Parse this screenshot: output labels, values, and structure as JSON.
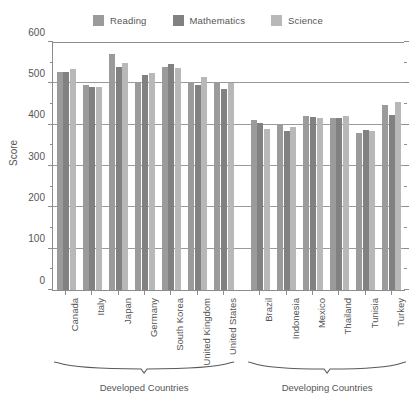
{
  "legend": {
    "entries": [
      {
        "label": "Reading",
        "color": "#9b9b9b",
        "icon": "legend-swatch-icon"
      },
      {
        "label": "Mathematics",
        "color": "#818181",
        "icon": "legend-swatch-icon"
      },
      {
        "label": "Science",
        "color": "#b8b8b8",
        "icon": "legend-swatch-icon"
      }
    ]
  },
  "axes": {
    "ylabel": "Score",
    "yticks": [
      0,
      100,
      200,
      300,
      400,
      500,
      600
    ],
    "yminor": [
      50,
      150,
      250,
      350,
      450,
      550
    ],
    "ylim": [
      0,
      600
    ]
  },
  "groups": [
    {
      "label": "Developed Countries",
      "count": 7
    },
    {
      "label": "Developing Countries",
      "count": 6
    }
  ],
  "chart_data": {
    "type": "bar",
    "title": "",
    "subtitle": "",
    "xlabel": "",
    "ylabel": "Score",
    "ylim": [
      0,
      600
    ],
    "yticks": [
      0,
      100,
      200,
      300,
      400,
      500,
      600
    ],
    "minor_tick_interval": 50,
    "grid": true,
    "grid_axis": "y",
    "legend_position": "top-center",
    "categories": [
      "Canada",
      "Italy",
      "Japan",
      "Germany",
      "South Korea",
      "United Kingdom",
      "United States",
      "Brazil",
      "Indonesia",
      "Mexico",
      "Thailand",
      "Tunisia",
      "Turkey"
    ],
    "category_groups": [
      {
        "name": "Developed Countries",
        "categories": [
          "Canada",
          "Italy",
          "Japan",
          "Germany",
          "South Korea",
          "United Kingdom",
          "United States"
        ]
      },
      {
        "name": "Developing Countries",
        "categories": [
          "Brazil",
          "Indonesia",
          "Mexico",
          "Thailand",
          "Tunisia",
          "Turkey"
        ]
      }
    ],
    "series": [
      {
        "name": "Reading",
        "color": "#9b9b9b",
        "values": [
          527,
          495,
          570,
          500,
          540,
          500,
          500,
          412,
          402,
          420,
          417,
          380,
          447
        ]
      },
      {
        "name": "Mathematics",
        "color": "#818181",
        "values": [
          527,
          490,
          540,
          520,
          547,
          495,
          487,
          405,
          385,
          419,
          417,
          387,
          424
        ]
      },
      {
        "name": "Science",
        "color": "#b8b8b8",
        "values": [
          534,
          491,
          550,
          524,
          538,
          515,
          502,
          390,
          395,
          416,
          421,
          384,
          454
        ]
      }
    ]
  }
}
